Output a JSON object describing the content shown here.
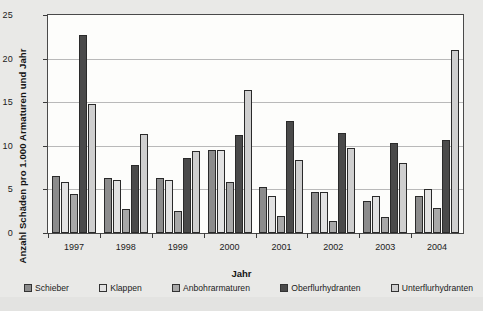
{
  "chart_data": {
    "type": "bar",
    "title": "",
    "xlabel": "Jahr",
    "ylabel": "Anzahl Schäden pro 1.000 Armaturen und Jahr",
    "categories": [
      "1997",
      "1998",
      "1999",
      "2000",
      "2001",
      "2002",
      "2003",
      "2004"
    ],
    "ylim": [
      0,
      25
    ],
    "yticks": [
      0,
      5,
      10,
      15,
      20,
      25
    ],
    "grid": true,
    "legend_position": "bottom",
    "series": [
      {
        "name": "Schieber",
        "color": "#8c8c8c",
        "values": [
          6.5,
          6.3,
          6.3,
          9.5,
          5.3,
          4.7,
          3.7,
          4.2
        ]
      },
      {
        "name": "Klappen",
        "color": "#e2e2e2",
        "values": [
          5.9,
          6.1,
          6.1,
          9.5,
          4.2,
          4.7,
          4.2,
          5.0
        ]
      },
      {
        "name": "Anbohrarmaturen",
        "color": "#a8a8a8",
        "values": [
          4.5,
          2.8,
          2.5,
          5.9,
          1.9,
          1.4,
          1.8,
          2.9
        ]
      },
      {
        "name": "Oberflurhydranten",
        "color": "#4a4a4a",
        "values": [
          22.7,
          7.8,
          8.6,
          11.2,
          12.9,
          11.5,
          10.3,
          10.7
        ]
      },
      {
        "name": "Unterflurhydranten",
        "color": "#cfcfcf",
        "values": [
          14.8,
          11.3,
          9.4,
          16.4,
          8.4,
          9.8,
          8.0,
          21.0
        ]
      }
    ]
  }
}
